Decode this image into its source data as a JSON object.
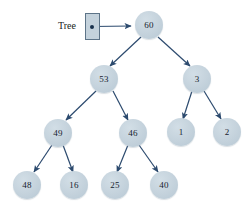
{
  "diagram": {
    "title_label": "Tree",
    "colors": {
      "node_fill": "#c4d2dc",
      "node_text": "#16222e",
      "edge": "#2c4a6e",
      "box_border": "#5d7488",
      "box_fill": "#c4d2dc",
      "background": "#ffffff"
    },
    "pointer": {
      "name": "tree-root-pointer",
      "dot_label": ""
    },
    "nodes": [
      {
        "id": "n60",
        "value": "60",
        "x": 149,
        "y": 25,
        "level": 0
      },
      {
        "id": "n53",
        "value": "53",
        "x": 104,
        "y": 79,
        "level": 1
      },
      {
        "id": "n3",
        "value": "3",
        "x": 197,
        "y": 79,
        "level": 1
      },
      {
        "id": "n49",
        "value": "49",
        "x": 58,
        "y": 133,
        "level": 2
      },
      {
        "id": "n46",
        "value": "46",
        "x": 133,
        "y": 133,
        "level": 2
      },
      {
        "id": "n1",
        "value": "1",
        "x": 181,
        "y": 132,
        "level": 2
      },
      {
        "id": "n2",
        "value": "2",
        "x": 227,
        "y": 132,
        "level": 2
      },
      {
        "id": "n48",
        "value": "48",
        "x": 27,
        "y": 185,
        "level": 3
      },
      {
        "id": "n16",
        "value": "16",
        "x": 74,
        "y": 185,
        "level": 3
      },
      {
        "id": "n25",
        "value": "25",
        "x": 115,
        "y": 185,
        "level": 3
      },
      {
        "id": "n40",
        "value": "40",
        "x": 164,
        "y": 185,
        "level": 3
      }
    ],
    "edges": [
      {
        "from": "pointer",
        "to": "n60",
        "kind": "horizontal-arrow"
      },
      {
        "from": "n60",
        "to": "n53",
        "kind": "arrow"
      },
      {
        "from": "n60",
        "to": "n3",
        "kind": "arrow"
      },
      {
        "from": "n53",
        "to": "n49",
        "kind": "arrow"
      },
      {
        "from": "n53",
        "to": "n46",
        "kind": "arrow"
      },
      {
        "from": "n3",
        "to": "n1",
        "kind": "arrow"
      },
      {
        "from": "n3",
        "to": "n2",
        "kind": "arrow"
      },
      {
        "from": "n49",
        "to": "n48",
        "kind": "arrow"
      },
      {
        "from": "n49",
        "to": "n16",
        "kind": "arrow"
      },
      {
        "from": "n46",
        "to": "n25",
        "kind": "arrow"
      },
      {
        "from": "n46",
        "to": "n40",
        "kind": "arrow"
      }
    ]
  }
}
